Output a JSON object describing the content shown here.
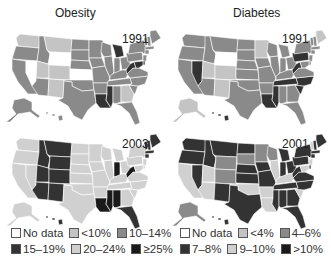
{
  "titles": {
    "left": "Obesity",
    "right": "Diabetes"
  },
  "colors": {
    "nodata": "#ffffff",
    "light": "#c8c8c8",
    "medium": "#8e8e8e",
    "dark": "#2a2a2a",
    "lighter": "#d3d3d3",
    "black": "#141414"
  },
  "legends": {
    "obesity": [
      {
        "label": "No data",
        "color": "#ffffff"
      },
      {
        "label": "<10%",
        "color": "#c4c4c4"
      },
      {
        "label": "10–14%",
        "color": "#8a8a8a"
      },
      {
        "label": "15–19%",
        "color": "#333333"
      },
      {
        "label": "20–24%",
        "color": "#d0d0d0"
      },
      {
        "label": "≥25%",
        "color": "#1a1a1a"
      }
    ],
    "diabetes": [
      {
        "label": "No data",
        "color": "#ffffff"
      },
      {
        "label": "<4%",
        "color": "#c4c4c4"
      },
      {
        "label": "4–6%",
        "color": "#8a8a8a"
      },
      {
        "label": "7–8%",
        "color": "#333333"
      },
      {
        "label": "9–10%",
        "color": "#d0d0d0"
      },
      {
        "label": ">10%",
        "color": "#1a1a1a"
      }
    ]
  },
  "chart_data": [
    {
      "type": "choropleth",
      "title": "Obesity",
      "year": "1991",
      "categories": [
        "No data",
        "<10%",
        "10–14%",
        "15–19%",
        "20–24%",
        "≥25%"
      ],
      "states": {
        "WA": "<10%",
        "OR": "10–14%",
        "CA": "10–14%",
        "NV": "No data",
        "ID": "10–14%",
        "MT": "<10%",
        "WY": "No data",
        "UT": "<10%",
        "CO": "<10%",
        "AZ": "10–14%",
        "NM": "<10%",
        "ND": "10–14%",
        "SD": "10–14%",
        "NE": "10–14%",
        "KS": "No data",
        "OK": "10–14%",
        "TX": "10–14%",
        "MN": "10–14%",
        "IA": "10–14%",
        "MO": "10–14%",
        "AR": "10–14%",
        "LA": "15–19%",
        "WI": "10–14%",
        "IL": "10–14%",
        "MI": "15–19%",
        "IN": "10–14%",
        "OH": "10–14%",
        "KY": "10–14%",
        "TN": "10–14%",
        "MS": "15–19%",
        "AL": "10–14%",
        "GA": "<10%",
        "FL": "10–14%",
        "SC": "10–14%",
        "NC": "10–14%",
        "VA": "10–14%",
        "WV": "15–19%",
        "PA": "10–14%",
        "NY": "10–14%",
        "VT": "10–14%",
        "NH": "10–14%",
        "ME": "10–14%",
        "MA": "10–14%",
        "CT": "10–14%",
        "NJ": "10–14%",
        "DE": "15–19%",
        "MD": "15–19%",
        "AK": "10–14%",
        "HI": "10–14%"
      }
    },
    {
      "type": "choropleth",
      "title": "Obesity",
      "year": "2003",
      "categories": [
        "No data",
        "<10%",
        "10–14%",
        "15–19%",
        "20–24%",
        "≥25%"
      ],
      "states": {
        "WA": "20–24%",
        "OR": "20–24%",
        "CA": "20–24%",
        "NV": "20–24%",
        "ID": "15–19%",
        "MT": "15–19%",
        "WY": "15–19%",
        "UT": "15–19%",
        "CO": "15–19%",
        "AZ": "15–19%",
        "NM": "15–19%",
        "ND": "20–24%",
        "SD": "20–24%",
        "NE": "20–24%",
        "KS": "20–24%",
        "OK": "20–24%",
        "TX": "20–24%",
        "MN": "20–24%",
        "IA": "20–24%",
        "MO": "20–24%",
        "AR": "20–24%",
        "LA": "≥25%",
        "WI": "20–24%",
        "IL": "20–24%",
        "MI": "20–24%",
        "IN": "≥25%",
        "OH": "20–24%",
        "KY": "20–24%",
        "TN": "20–24%",
        "MS": "≥25%",
        "AL": "≥25%",
        "GA": "20–24%",
        "FL": "15–19%",
        "SC": "20–24%",
        "NC": "20–24%",
        "VA": "20–24%",
        "WV": "≥25%",
        "PA": "20–24%",
        "NY": "20–24%",
        "VT": "15–19%",
        "NH": "15–19%",
        "ME": "15–19%",
        "MA": "15–19%",
        "CT": "15–19%",
        "NJ": "20–24%",
        "DE": "20–24%",
        "MD": "20–24%",
        "AK": "20–24%",
        "HI": "15–19%"
      }
    },
    {
      "type": "choropleth",
      "title": "Diabetes",
      "year": "1991",
      "categories": [
        "No data",
        "<4%",
        "4–6%",
        "7–8%",
        "9–10%",
        ">10%"
      ],
      "states": {
        "WA": "4–6%",
        "OR": "4–6%",
        "CA": "4–6%",
        "NV": "7–8%",
        "ID": "4–6%",
        "MT": "4–6%",
        "WY": "No data",
        "UT": "<4%",
        "CO": "<4%",
        "AZ": "4–6%",
        "NM": "<4%",
        "ND": "4–6%",
        "SD": "4–6%",
        "NE": "4–6%",
        "KS": "4–6%",
        "OK": "4–6%",
        "TX": "4–6%",
        "MN": "<4%",
        "IA": "4–6%",
        "MO": "4–6%",
        "AR": "4–6%",
        "LA": "7–8%",
        "WI": "4–6%",
        "IL": "4–6%",
        "MI": "4–6%",
        "IN": "4–6%",
        "OH": "4–6%",
        "KY": "4–6%",
        "TN": "7–8%",
        "MS": "7–8%",
        "AL": "4–6%",
        "GA": "4–6%",
        "FL": "4–6%",
        "SC": "7–8%",
        "NC": "7–8%",
        "VA": "4–6%",
        "WV": "7–8%",
        "PA": "7–8%",
        "NY": "4–6%",
        "VT": "4–6%",
        "NH": "4–6%",
        "ME": "<4%",
        "MA": "4–6%",
        "CT": "4–6%",
        "NJ": "4–6%",
        "DE": "4–6%",
        "MD": "4–6%",
        "AK": "<4%",
        "HI": "7–8%"
      }
    },
    {
      "type": "choropleth",
      "title": "Diabetes",
      "year": "2001",
      "categories": [
        "No data",
        "<4%",
        "4–6%",
        "7–8%",
        "9–10%",
        ">10%"
      ],
      "states": {
        "WA": "7–8%",
        "OR": "7–8%",
        "CA": "9–10%",
        "NV": "7–8%",
        "ID": "7–8%",
        "MT": "7–8%",
        "WY": "4–6%",
        "UT": "9–10%",
        "CO": "4–6%",
        "AZ": "9–10%",
        "NM": "7–8%",
        "ND": "7–8%",
        "SD": "4–6%",
        "NE": "7–8%",
        "KS": "7–8%",
        "OK": "9–10%",
        "TX": "7–8%",
        "MN": "4–6%",
        "IA": "7–8%",
        "MO": "7–8%",
        "AR": "9–10%",
        "LA": "9–10%",
        "WI": "4–6%",
        "IL": "9–10%",
        "MI": "7–8%",
        "IN": "7–8%",
        "OH": "7–8%",
        "KY": "9–10%",
        "TN": "7–8%",
        "MS": "7–8%",
        "AL": "7–8%",
        "GA": "7–8%",
        "FL": "7–8%",
        "SC": "9–10%",
        "NC": "7–8%",
        "VA": "7–8%",
        "WV": "7–8%",
        "PA": "7–8%",
        "NY": "7–8%",
        "VT": "9–10%",
        "NH": "7–8%",
        "ME": "7–8%",
        "MA": "7–8%",
        "CT": "7–8%",
        "NJ": "9–10%",
        "DE": "7–8%",
        "MD": "9–10%",
        "AK": "4–6%",
        "HI": "7–8%"
      }
    }
  ]
}
